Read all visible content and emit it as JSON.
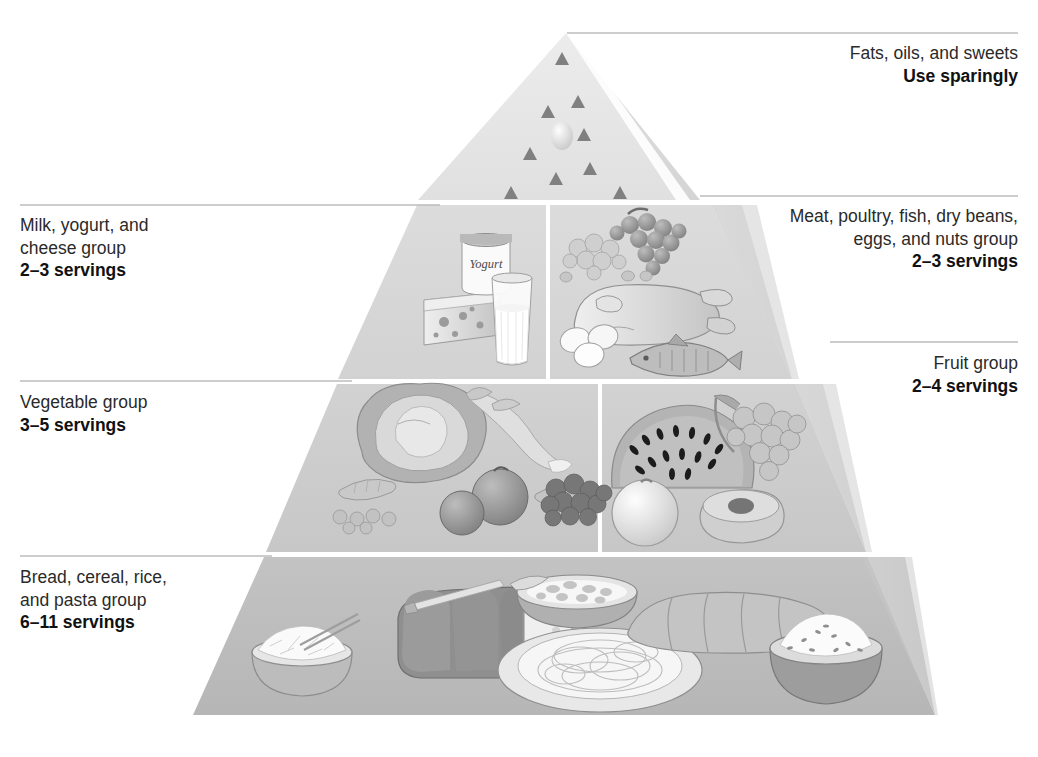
{
  "diagram": {
    "shape": "pyramid",
    "background": "#ffffff"
  },
  "colors": {
    "tier_top": "#e2e2e2",
    "tier_second": "#d6d6d6",
    "tier_third": "#cccccc",
    "tier_base": "#bdbdbd",
    "side_face": "#d3d3d3",
    "divider": "#ffffff",
    "leader_line": "#bdbdbd",
    "label_text": "#2a2a2a",
    "serving_text": "#111111"
  },
  "tiers": [
    {
      "id": "fats-oils-sweets",
      "group_label": "Fats, oils, and sweets",
      "servings_label": "Use sparingly",
      "side": "right",
      "symbols": [
        "fat-triangle",
        "sugar-circle"
      ]
    },
    {
      "id": "milk-yogurt-cheese",
      "group_label_lines": [
        "Milk, yogurt, and",
        "cheese group"
      ],
      "servings_label": "2–3 servings",
      "side": "left",
      "foods": [
        "yogurt-container",
        "cheese-wedge",
        "milk-glass"
      ],
      "yogurt_text": "Yogurt"
    },
    {
      "id": "meat-poultry-fish",
      "group_label_lines": [
        "Meat, poultry, fish, dry beans,",
        "eggs, and nuts group"
      ],
      "servings_label": "2–3 servings",
      "side": "right",
      "foods": [
        "grapes-nuts",
        "poultry",
        "eggs",
        "fish"
      ]
    },
    {
      "id": "vegetable-group",
      "group_label": "Vegetable group",
      "servings_label": "3–5 servings",
      "side": "left",
      "foods": [
        "lettuce",
        "carrot",
        "peas",
        "tomatoes",
        "broccoli"
      ]
    },
    {
      "id": "fruit-group",
      "group_label": "Fruit group",
      "servings_label": "2–4 servings",
      "side": "right",
      "foods": [
        "watermelon-slice",
        "grapes",
        "orange",
        "melon-half"
      ]
    },
    {
      "id": "bread-cereal-rice-pasta",
      "group_label_lines": [
        "Bread, cereal, rice,",
        "and pasta group"
      ],
      "servings_label": "6–11 servings",
      "side": "left",
      "foods": [
        "rice-bowl",
        "bread-loaf-sliced",
        "cereal-bowl",
        "pasta-plate",
        "baguette",
        "grain-bowl"
      ]
    }
  ]
}
